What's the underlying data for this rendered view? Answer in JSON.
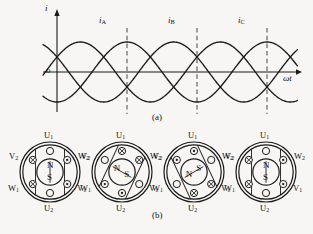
{
  "figure": {
    "background_color": "#f7f6f4",
    "ink_color": "#1a1a1a",
    "dash_color": "#555555",
    "part_a_label": "(a)",
    "part_b_label": "(b)"
  },
  "waveform": {
    "axis": {
      "y_axis_label": "i",
      "x_axis_label": "ωt",
      "origin_label": "o",
      "origin_px": {
        "x": 57,
        "y": 72
      },
      "x_end_px": 302,
      "y_top_px": 14,
      "y_bottom_px": 112
    },
    "curve_labels": [
      {
        "name": "i_A",
        "base": "i",
        "sub": "A",
        "x": 99,
        "y": 16
      },
      {
        "name": "i_B",
        "base": "i",
        "sub": "B",
        "x": 168,
        "y": 16
      },
      {
        "name": "i_C",
        "base": "i",
        "sub": "C",
        "x": 238,
        "y": 16
      }
    ],
    "markers_px": [
      127,
      197,
      267
    ],
    "amplitude_px": 30,
    "period_px": 140,
    "phase_offsets_deg": [
      0,
      -120,
      -240
    ],
    "start_phase_deg": 30
  },
  "chart_data": {
    "type": "line",
    "xlabel": "ωt",
    "ylabel": "i",
    "grid": false,
    "legend": "inline-curve-labels",
    "xlim": [
      0,
      720
    ],
    "ylim": [
      -1,
      1
    ],
    "series": [
      {
        "name": "iA",
        "phase_deg": 0,
        "amplitude": 1,
        "formula": "iA = Im sin(wt)"
      },
      {
        "name": "iB",
        "phase_deg": -120,
        "amplitude": 1,
        "formula": "iB = Im sin(wt - 120)"
      },
      {
        "name": "iC",
        "phase_deg": -240,
        "amplitude": 1,
        "formula": "iC = Im sin(wt - 240)"
      }
    ],
    "marker_lines_deg": [
      180,
      360,
      540
    ],
    "annotations": [
      "iA",
      "iB",
      "iC"
    ]
  },
  "motors": [
    {
      "id": "motor-1",
      "cx": 50,
      "cy": 172,
      "terminals": {
        "top": "U1",
        "bottom": "U2",
        "upper_left": "V2",
        "upper_right": "W2",
        "lower_left": "W1",
        "lower_right": "V1"
      },
      "poles": {
        "top": "N",
        "bottom": "S"
      },
      "field_angle_deg": 0,
      "slot_marks": [
        {
          "pos": "top",
          "mark": "empty"
        },
        {
          "pos": "bottom",
          "mark": "empty"
        },
        {
          "pos": "upper-left",
          "mark": "cross"
        },
        {
          "pos": "lower-left",
          "mark": "cross"
        },
        {
          "pos": "upper-right",
          "mark": "dot"
        },
        {
          "pos": "lower-right",
          "mark": "dot"
        }
      ]
    },
    {
      "id": "motor-2",
      "cx": 122,
      "cy": 172,
      "terminals": {
        "top": "U1",
        "bottom": "U2",
        "upper_left": "V2",
        "upper_right": "W2",
        "lower_left": "W1",
        "lower_right": "V1"
      },
      "poles": {
        "top": "S",
        "bottom": "N"
      },
      "field_angle_deg": 120,
      "slot_marks": [
        {
          "pos": "top",
          "mark": "cross"
        },
        {
          "pos": "bottom",
          "mark": "dot"
        },
        {
          "pos": "upper-left",
          "mark": "empty"
        },
        {
          "pos": "lower-left",
          "mark": "dot"
        },
        {
          "pos": "upper-right",
          "mark": "cross"
        },
        {
          "pos": "lower-right",
          "mark": "empty"
        }
      ]
    },
    {
      "id": "motor-3",
      "cx": 194,
      "cy": 172,
      "terminals": {
        "top": "U1",
        "bottom": "U2",
        "upper_left": "V2",
        "upper_right": "W2",
        "lower_left": "W1",
        "lower_right": "V1"
      },
      "poles": {
        "top": "N",
        "bottom": "S"
      },
      "field_angle_deg": 240,
      "slot_marks": [
        {
          "pos": "top",
          "mark": "dot"
        },
        {
          "pos": "bottom",
          "mark": "cross"
        },
        {
          "pos": "upper-left",
          "mark": "dot"
        },
        {
          "pos": "lower-left",
          "mark": "empty"
        },
        {
          "pos": "upper-right",
          "mark": "empty"
        },
        {
          "pos": "lower-right",
          "mark": "cross"
        }
      ]
    },
    {
      "id": "motor-4",
      "cx": 266,
      "cy": 172,
      "terminals": {
        "top": "U1",
        "bottom": "U2",
        "upper_left": "V2",
        "upper_right": "W2",
        "lower_left": "W1",
        "lower_right": "V1"
      },
      "poles": {
        "top": "N",
        "bottom": "S"
      },
      "field_angle_deg": 360,
      "slot_marks": [
        {
          "pos": "top",
          "mark": "empty"
        },
        {
          "pos": "bottom",
          "mark": "empty"
        },
        {
          "pos": "upper-left",
          "mark": "cross"
        },
        {
          "pos": "lower-left",
          "mark": "cross"
        },
        {
          "pos": "upper-right",
          "mark": "dot"
        },
        {
          "pos": "lower-right",
          "mark": "dot"
        }
      ]
    }
  ]
}
